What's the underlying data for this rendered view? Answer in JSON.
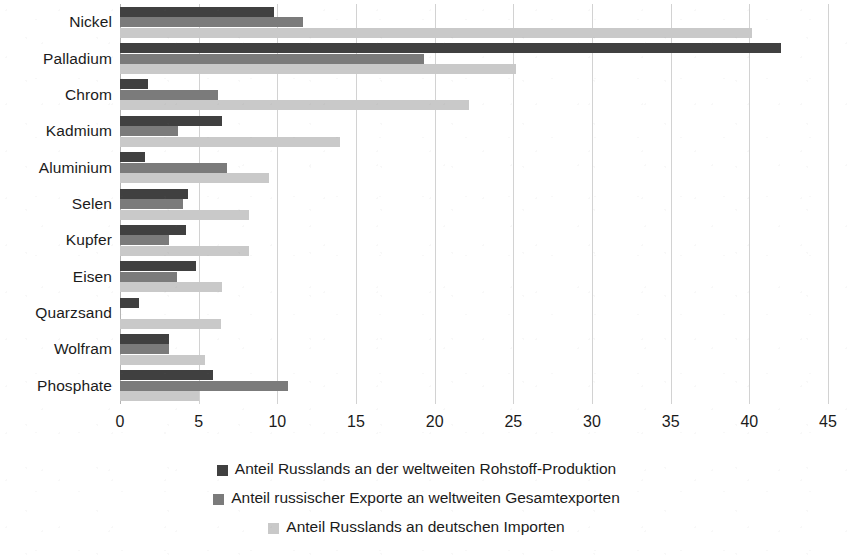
{
  "chart_data": {
    "type": "bar",
    "orientation": "horizontal",
    "title": "",
    "subtitle": "",
    "xlabel": "",
    "ylabel": "",
    "xlim": [
      0,
      45
    ],
    "xticks": [
      "0",
      "5",
      "10",
      "15",
      "20",
      "25",
      "30",
      "35",
      "40",
      "45"
    ],
    "xtick_values": [
      0,
      5,
      10,
      15,
      20,
      25,
      30,
      35,
      40,
      45
    ],
    "grid": "vertical",
    "legend_position": "bottom",
    "categories": [
      "Nickel",
      "Palladium",
      "Chrom",
      "Kadmium",
      "Aluminium",
      "Selen",
      "Kupfer",
      "Eisen",
      "Quarzsand",
      "Wolfram",
      "Phosphate"
    ],
    "series": [
      {
        "name": "Anteil Russlands an der weltweiten Rohstoff-Produktion",
        "color": "#404040",
        "values": [
          9.8,
          42.0,
          1.8,
          6.5,
          1.6,
          4.3,
          4.2,
          4.8,
          1.2,
          3.1,
          5.9
        ]
      },
      {
        "name": "Anteil russischer Exporte an weltweiten Gesamtexporten",
        "color": "#7b7b7b",
        "values": [
          11.6,
          19.3,
          6.2,
          3.7,
          6.8,
          4.0,
          3.1,
          3.6,
          0.0,
          3.1,
          10.7
        ]
      },
      {
        "name": "Anteil Russlands an deutschen Importen",
        "color": "#c9c9c9",
        "values": [
          40.2,
          25.2,
          22.2,
          14.0,
          9.5,
          8.2,
          8.2,
          6.5,
          6.4,
          5.4,
          5.0
        ]
      }
    ]
  },
  "colors": {
    "background": "#ffffff",
    "text": "#1b1b1b",
    "gridline": "#d2d2d2",
    "axis": "#b4b4b4",
    "series_production": "#404040",
    "series_exports": "#7b7b7b",
    "series_imports": "#c9c9c9"
  }
}
